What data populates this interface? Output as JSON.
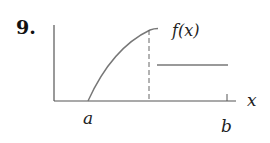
{
  "problem": {
    "number": "9."
  },
  "diagram": {
    "function_label": "f(x)",
    "x_axis_label": "x",
    "point_a_label": "a",
    "point_b_label": "b",
    "colors": {
      "axis": "#555555",
      "curve": "#777777",
      "text": "#222222"
    }
  }
}
